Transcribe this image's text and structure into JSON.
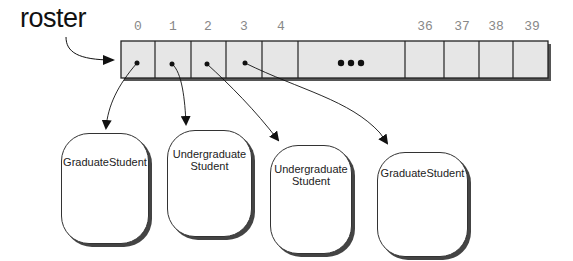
{
  "variable": {
    "name": "roster"
  },
  "array": {
    "indices": [
      "0",
      "1",
      "2",
      "3",
      "4",
      "36",
      "37",
      "38",
      "39"
    ],
    "ellipsis": "•••",
    "fill_color": "#e6e6e6",
    "border_color": "#222222"
  },
  "objects": [
    {
      "line1": "GraduateStudent",
      "line2": ""
    },
    {
      "line1": "Undergraduate",
      "line2": "Student"
    },
    {
      "line1": "Undergraduate",
      "line2": "Student"
    },
    {
      "line1": "GraduateStudent",
      "line2": ""
    }
  ]
}
